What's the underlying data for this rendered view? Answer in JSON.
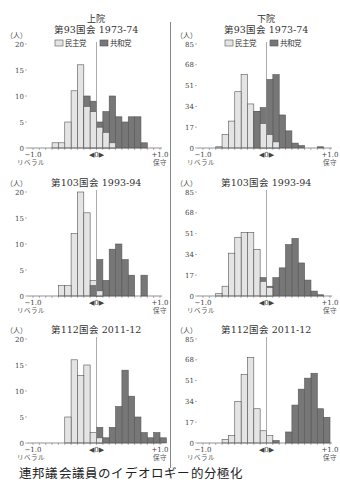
{
  "caption": "連邦議会議員のイデオロギー的分極化",
  "legend": {
    "dem": "民主党",
    "rep": "共和党"
  },
  "axis": {
    "left": "−1.0",
    "left_sub": "リベラル",
    "center": "◀0▶",
    "right": "+1.0",
    "right_sub": "保守",
    "unit": "（人）"
  },
  "colors": {
    "dem": "#e4e4e4",
    "rep": "#777777",
    "edge": "#555555",
    "axis": "#666666"
  },
  "chart_data": [
    {
      "type": "bar",
      "chamber": "上院",
      "title": "第93国会  1973-74",
      "xlabel": "−1.0 リベラル ← 0 → +1.0 保守",
      "ylabel": "人",
      "xlim": [
        -1.0,
        1.0
      ],
      "ylim": [
        0,
        20
      ],
      "yticks": [
        0,
        5,
        10,
        15,
        20
      ],
      "bin_width": 0.1,
      "series": [
        {
          "name": "民主党",
          "x": [
            -0.7,
            -0.6,
            -0.5,
            -0.4,
            -0.3,
            -0.2,
            -0.1,
            0.0,
            0.1,
            0.2
          ],
          "values": [
            1,
            1,
            5,
            11,
            16,
            8,
            7,
            4,
            3,
            1
          ]
        },
        {
          "name": "共和党",
          "x": [
            -0.2,
            -0.1,
            0.0,
            0.1,
            0.2,
            0.3,
            0.4,
            0.5,
            0.6,
            0.7
          ],
          "values": [
            10,
            9,
            5,
            7,
            10,
            6,
            5,
            6,
            6,
            1
          ]
        }
      ]
    },
    {
      "type": "bar",
      "chamber": "下院",
      "title": "第93国会  1973-74",
      "xlim": [
        -1.0,
        1.0
      ],
      "ylim": [
        0,
        85
      ],
      "yticks": [
        0,
        17,
        34,
        51,
        68,
        85
      ],
      "bin_width": 0.1,
      "series": [
        {
          "name": "民主党",
          "x": [
            -0.8,
            -0.7,
            -0.6,
            -0.5,
            -0.4,
            -0.3,
            -0.2,
            -0.1,
            0.0,
            0.1
          ],
          "values": [
            1,
            11,
            22,
            46,
            60,
            36,
            30,
            20,
            11,
            5
          ]
        },
        {
          "name": "共和党",
          "x": [
            -0.2,
            -0.1,
            0.0,
            0.1,
            0.2,
            0.3,
            0.4,
            0.5,
            0.6,
            0.8
          ],
          "values": [
            30,
            33,
            56,
            60,
            27,
            14,
            4,
            2,
            0,
            1
          ]
        }
      ]
    },
    {
      "type": "bar",
      "chamber": "上院",
      "title": "第103国会  1993-94",
      "xlim": [
        -1.0,
        1.0
      ],
      "ylim": [
        0,
        20
      ],
      "yticks": [
        0,
        5,
        10,
        15,
        20
      ],
      "bin_width": 0.1,
      "series": [
        {
          "name": "民主党",
          "x": [
            -0.6,
            -0.5,
            -0.4,
            -0.3,
            -0.2,
            -0.1,
            0.0,
            -0.0
          ],
          "values": [
            2,
            2,
            12,
            20,
            16,
            3,
            1,
            1
          ]
        },
        {
          "name": "共和党",
          "x": [
            -0.1,
            0.0,
            0.1,
            0.2,
            0.3,
            0.4,
            0.5,
            0.7
          ],
          "values": [
            2,
            7,
            3,
            9,
            10,
            7,
            4,
            4
          ]
        }
      ]
    },
    {
      "type": "bar",
      "chamber": "下院",
      "title": "第103国会  1993-94",
      "xlim": [
        -1.0,
        1.0
      ],
      "ylim": [
        0,
        85
      ],
      "yticks": [
        0,
        17,
        34,
        51,
        68,
        85
      ],
      "bin_width": 0.1,
      "series": [
        {
          "name": "民主党",
          "x": [
            -0.8,
            -0.7,
            -0.6,
            -0.5,
            -0.4,
            -0.3,
            -0.2,
            -0.1,
            0.0
          ],
          "values": [
            2,
            8,
            35,
            48,
            52,
            52,
            38,
            12,
            7
          ]
        },
        {
          "name": "共和党",
          "x": [
            -0.1,
            0.0,
            0.1,
            0.2,
            0.3,
            0.4,
            0.5,
            0.6,
            0.7,
            0.8
          ],
          "values": [
            15,
            8,
            15,
            23,
            42,
            47,
            27,
            13,
            4,
            1
          ]
        }
      ]
    },
    {
      "type": "bar",
      "chamber": "上院",
      "title": "第112国会  2011-12",
      "xlim": [
        -1.0,
        1.0
      ],
      "ylim": [
        0,
        20
      ],
      "yticks": [
        0,
        5,
        10,
        15,
        20
      ],
      "bin_width": 0.1,
      "series": [
        {
          "name": "民主党",
          "x": [
            -0.5,
            -0.4,
            -0.3,
            -0.2,
            -0.1,
            0.0
          ],
          "values": [
            5,
            16,
            13,
            15,
            2,
            1
          ]
        },
        {
          "name": "共和党",
          "x": [
            0.0,
            0.1,
            0.2,
            0.3,
            0.4,
            0.5,
            0.6,
            0.7,
            0.8,
            0.9,
            1.0
          ],
          "values": [
            3,
            1,
            3,
            7,
            14,
            9,
            5,
            2,
            1,
            2,
            1
          ]
        }
      ]
    },
    {
      "type": "bar",
      "chamber": "下院",
      "title": "第112国会  2011-12",
      "xlim": [
        -1.0,
        1.0
      ],
      "ylim": [
        0,
        85
      ],
      "yticks": [
        0,
        17,
        34,
        51,
        68,
        85
      ],
      "bin_width": 0.1,
      "series": [
        {
          "name": "民主党",
          "x": [
            -0.7,
            -0.6,
            -0.5,
            -0.4,
            -0.3,
            -0.2,
            -0.1,
            0.0
          ],
          "values": [
            3,
            6,
            34,
            56,
            70,
            28,
            10,
            6
          ]
        },
        {
          "name": "共和党",
          "x": [
            0.1,
            0.3,
            0.4,
            0.5,
            0.6,
            0.7,
            0.8,
            0.9
          ],
          "values": [
            2,
            9,
            31,
            44,
            53,
            57,
            28,
            21
          ]
        }
      ]
    }
  ]
}
